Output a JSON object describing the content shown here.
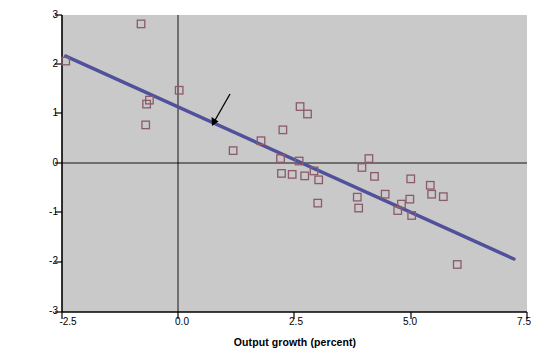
{
  "chart_data": {
    "type": "scatter",
    "title": "",
    "xlabel": "Output growth (percent)",
    "ylabel": "Change in the unemployment rate (percent)",
    "xlim": [
      -2.5,
      7.5
    ],
    "ylim": [
      -3,
      3
    ],
    "xticks": [
      "-2.5",
      "0.0",
      "2.5",
      "5.0",
      "7.5"
    ],
    "xtick_values": [
      -2.5,
      0.0,
      2.5,
      5.0,
      7.5
    ],
    "yticks": [
      "3",
      "2",
      "1",
      "0",
      "-1",
      "-2",
      "-3"
    ],
    "ytick_values": [
      3,
      2,
      1,
      0,
      -1,
      -2,
      -3
    ],
    "grid": false,
    "legend": "none",
    "plot_background": "#c9c9c9",
    "marker_color": "#8b5a6b",
    "marker_shape": "open-square",
    "line_color": "#51519b",
    "points": [
      {
        "x": -2.42,
        "y": 2.07
      },
      {
        "x": -0.8,
        "y": 2.82
      },
      {
        "x": -0.62,
        "y": 1.28
      },
      {
        "x": -0.68,
        "y": 1.2
      },
      {
        "x": -0.7,
        "y": 0.78
      },
      {
        "x": 0.02,
        "y": 1.48
      },
      {
        "x": 1.18,
        "y": 0.26
      },
      {
        "x": 1.78,
        "y": 0.46
      },
      {
        "x": 2.2,
        "y": 0.1
      },
      {
        "x": 2.25,
        "y": 0.68
      },
      {
        "x": 2.22,
        "y": -0.2
      },
      {
        "x": 2.45,
        "y": -0.22
      },
      {
        "x": 2.62,
        "y": 1.15
      },
      {
        "x": 2.78,
        "y": 1.0
      },
      {
        "x": 2.6,
        "y": 0.05
      },
      {
        "x": 2.72,
        "y": -0.25
      },
      {
        "x": 2.92,
        "y": -0.15
      },
      {
        "x": 3.02,
        "y": -0.33
      },
      {
        "x": 3.0,
        "y": -0.8
      },
      {
        "x": 3.85,
        "y": -0.68
      },
      {
        "x": 3.88,
        "y": -0.9
      },
      {
        "x": 3.95,
        "y": -0.08
      },
      {
        "x": 4.1,
        "y": 0.1
      },
      {
        "x": 4.22,
        "y": -0.26
      },
      {
        "x": 4.45,
        "y": -0.62
      },
      {
        "x": 4.72,
        "y": -0.95
      },
      {
        "x": 4.8,
        "y": -0.82
      },
      {
        "x": 4.98,
        "y": -0.72
      },
      {
        "x": 5.0,
        "y": -0.31
      },
      {
        "x": 5.02,
        "y": -1.05
      },
      {
        "x": 5.42,
        "y": -0.44
      },
      {
        "x": 5.45,
        "y": -0.62
      },
      {
        "x": 5.7,
        "y": -0.67
      },
      {
        "x": 6.0,
        "y": -2.04
      }
    ],
    "fit_line": {
      "slope": -0.4,
      "intercept": 1.2,
      "x_start": -2.42,
      "y_start": 2.17,
      "x_end": 7.22,
      "y_end": -1.93,
      "equation_text": "ut - ut-1 = -0.4(gyt - 3%)"
    },
    "annotation": {
      "equation_lhs_u": "u",
      "equation_sub_t": "t",
      "equation_minus": " − ",
      "equation_sub_t1": "t − 1",
      "equation_eq": " = −0.4(",
      "equation_g": "g",
      "equation_sub_yt": "yt",
      "equation_tail": " − 3%)",
      "arrow": "annotation-arrow"
    }
  }
}
